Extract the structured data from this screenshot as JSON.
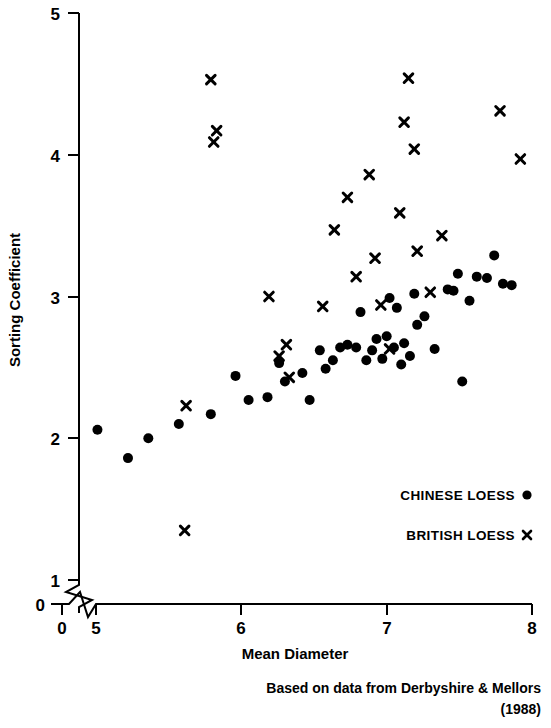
{
  "chart_data": {
    "type": "scatter",
    "title": "",
    "xlabel": "Mean Diameter",
    "ylabel": "Sorting Coefficient",
    "xlim": [
      5,
      8
    ],
    "ylim": [
      1,
      5
    ],
    "x_ticks": [
      "0",
      "5",
      "6",
      "7",
      "8"
    ],
    "y_ticks": [
      "0",
      "1",
      "2",
      "3",
      "4",
      "5"
    ],
    "axis_break": true,
    "grid": false,
    "legend_position": "bottom-right",
    "series": [
      {
        "name": "CHINESE LOESS",
        "marker": "filled-circle",
        "color": "#000000",
        "points": [
          [
            5.01,
            2.06
          ],
          [
            5.22,
            1.86
          ],
          [
            5.36,
            2.0
          ],
          [
            5.57,
            2.1
          ],
          [
            5.79,
            2.17
          ],
          [
            5.96,
            2.44
          ],
          [
            6.05,
            2.27
          ],
          [
            6.18,
            2.29
          ],
          [
            6.26,
            2.53
          ],
          [
            6.3,
            2.4
          ],
          [
            6.42,
            2.46
          ],
          [
            6.47,
            2.27
          ],
          [
            6.54,
            2.62
          ],
          [
            6.58,
            2.49
          ],
          [
            6.63,
            2.55
          ],
          [
            6.68,
            2.64
          ],
          [
            6.73,
            2.66
          ],
          [
            6.79,
            2.64
          ],
          [
            6.82,
            2.89
          ],
          [
            6.86,
            2.55
          ],
          [
            6.9,
            2.62
          ],
          [
            6.93,
            2.7
          ],
          [
            6.97,
            2.56
          ],
          [
            7.0,
            2.72
          ],
          [
            7.02,
            2.99
          ],
          [
            7.05,
            2.64
          ],
          [
            7.07,
            2.92
          ],
          [
            7.1,
            2.52
          ],
          [
            7.12,
            2.67
          ],
          [
            7.16,
            2.58
          ],
          [
            7.19,
            3.02
          ],
          [
            7.21,
            2.8
          ],
          [
            7.26,
            2.86
          ],
          [
            7.33,
            2.63
          ],
          [
            7.42,
            3.05
          ],
          [
            7.46,
            3.04
          ],
          [
            7.49,
            3.16
          ],
          [
            7.52,
            2.4
          ],
          [
            7.57,
            2.97
          ],
          [
            7.62,
            3.14
          ],
          [
            7.69,
            3.13
          ],
          [
            7.74,
            3.29
          ],
          [
            7.8,
            3.09
          ],
          [
            7.86,
            3.08
          ]
        ]
      },
      {
        "name": "BRITISH LOESS",
        "marker": "cross-x",
        "color": "#000000",
        "points": [
          [
            5.61,
            1.35
          ],
          [
            5.79,
            4.53
          ],
          [
            5.83,
            4.17
          ],
          [
            5.81,
            4.09
          ],
          [
            5.62,
            2.23
          ],
          [
            6.19,
            3.0
          ],
          [
            6.31,
            2.66
          ],
          [
            6.26,
            2.58
          ],
          [
            6.33,
            2.43
          ],
          [
            6.64,
            3.47
          ],
          [
            6.56,
            2.93
          ],
          [
            6.73,
            3.7
          ],
          [
            6.79,
            3.14
          ],
          [
            6.88,
            3.86
          ],
          [
            6.92,
            3.27
          ],
          [
            6.96,
            2.94
          ],
          [
            7.02,
            2.63
          ],
          [
            7.09,
            3.59
          ],
          [
            7.12,
            4.23
          ],
          [
            7.15,
            4.54
          ],
          [
            7.21,
            3.32
          ],
          [
            7.19,
            4.04
          ],
          [
            7.3,
            3.03
          ],
          [
            7.38,
            3.43
          ],
          [
            7.78,
            4.31
          ],
          [
            7.92,
            3.97
          ]
        ]
      }
    ]
  },
  "legend": {
    "chinese_label": "CHINESE LOESS",
    "british_label": "BRITISH LOESS"
  },
  "caption": {
    "line1": "Based on data from Derbyshire & Mellors",
    "line2": "(1988)"
  }
}
